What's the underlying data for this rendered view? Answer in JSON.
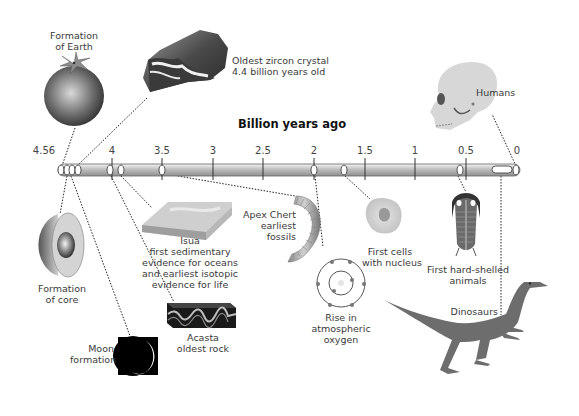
{
  "diagram": {
    "title": "Billion years ago",
    "axis": {
      "ticks": [
        {
          "label": "4.56",
          "x": 44
        },
        {
          "label": "4",
          "x": 112
        },
        {
          "label": "3.5",
          "x": 162
        },
        {
          "label": "3",
          "x": 213
        },
        {
          "label": "2.5",
          "x": 263
        },
        {
          "label": "2",
          "x": 314
        },
        {
          "label": "1.5",
          "x": 365
        },
        {
          "label": "1",
          "x": 415
        },
        {
          "label": "0.5",
          "x": 466
        },
        {
          "label": "0",
          "x": 517
        }
      ]
    },
    "events": [
      {
        "id": "earth",
        "label_lines": [
          "Formation",
          "of Earth"
        ],
        "icon": "earth-globe-icon"
      },
      {
        "id": "zircon",
        "label_lines": [
          "Oldest zircon crystal",
          "4.4 billion years old"
        ],
        "icon": "zircon-crystal-icon"
      },
      {
        "id": "core",
        "label_lines": [
          "Formation",
          "of core"
        ],
        "icon": "earth-core-cutaway-icon"
      },
      {
        "id": "moon",
        "label_lines": [
          "Moon",
          "formation"
        ],
        "icon": "moon-crescent-icon"
      },
      {
        "id": "acasta",
        "label_lines": [
          "Acasta",
          "oldest rock"
        ],
        "icon": "rock-strata-icon"
      },
      {
        "id": "isua",
        "label_lines": [
          "Isua",
          "first sedimentary",
          "evidence for oceans",
          "and earliest isotopic",
          "evidence for life"
        ],
        "icon": "sediment-slab-icon"
      },
      {
        "id": "apex",
        "label_lines": [
          "Apex Chert",
          "earliest",
          "fossils"
        ],
        "icon": "fossil-filament-icon"
      },
      {
        "id": "oxygen",
        "label_lines": [
          "Rise in",
          "atmospheric",
          "oxygen"
        ],
        "icon": "oxygen-atom-icon"
      },
      {
        "id": "cells",
        "label_lines": [
          "First cells",
          "with nucleus"
        ],
        "icon": "nucleated-cell-icon"
      },
      {
        "id": "shelled",
        "label_lines": [
          "First hard-shelled",
          "animals"
        ],
        "icon": "trilobite-icon"
      },
      {
        "id": "dinosaurs",
        "label_lines": [
          "Dinosaurs"
        ],
        "icon": "dinosaur-icon"
      },
      {
        "id": "humans",
        "label_lines": [
          "Humans"
        ],
        "icon": "human-skull-icon"
      }
    ]
  }
}
